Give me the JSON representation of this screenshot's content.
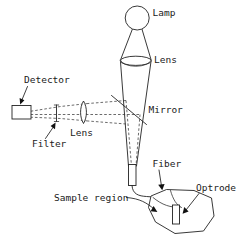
{
  "figure": {
    "background_color": "#ffffff",
    "line_color": "#222222",
    "text_color": "#1a1a1a",
    "width": 248,
    "height": 245
  },
  "labels": {
    "lamp": "Lamp",
    "lens_condenser": "Lens",
    "mirror": "Mirror",
    "detector": "Detector",
    "filter": "Filter",
    "lens_collection": "Lens",
    "fiber": "Fiber",
    "optrode": "Optrode",
    "sample_region": "Sample region"
  },
  "components": [
    {
      "name": "lamp",
      "shape": "circle",
      "label": "Lamp"
    },
    {
      "name": "condenser-lens",
      "shape": "ellipse",
      "label": "Lens"
    },
    {
      "name": "mirror",
      "shape": "line",
      "label": "Mirror"
    },
    {
      "name": "detector",
      "shape": "rectangle",
      "label": "Detector"
    },
    {
      "name": "filter",
      "shape": "vertical-bar",
      "label": "Filter"
    },
    {
      "name": "collection-lens",
      "shape": "biconvex-lens",
      "label": "Lens"
    },
    {
      "name": "fiber-coupler",
      "shape": "small-rectangle",
      "label": ""
    },
    {
      "name": "fiber",
      "shape": "curve",
      "label": "Fiber"
    },
    {
      "name": "optrode",
      "shape": "small-rectangle",
      "label": "Optrode"
    },
    {
      "name": "sample-region",
      "shape": "irregular-polygon",
      "label": "Sample region"
    }
  ]
}
